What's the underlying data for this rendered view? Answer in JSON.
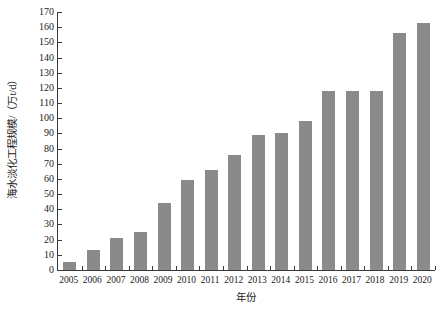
{
  "chart_data": {
    "type": "bar",
    "title": "",
    "subtitle": "",
    "xlabel": "年份",
    "ylabel": "海水淡化工程规模/（万t/d）",
    "categories": [
      "2005",
      "2006",
      "2007",
      "2008",
      "2009",
      "2010",
      "2011",
      "2012",
      "2013",
      "2014",
      "2015",
      "2016",
      "2017",
      "2018",
      "2019",
      "2020"
    ],
    "values": [
      5,
      13,
      21,
      25,
      44,
      59,
      66,
      76,
      89,
      90,
      98,
      118,
      118,
      118,
      156,
      163
    ],
    "series": [
      {
        "name": "海水淡化工程规模",
        "values": [
          5,
          13,
          21,
          25,
          44,
          59,
          66,
          76,
          89,
          90,
          98,
          118,
          118,
          118,
          156,
          163
        ]
      }
    ],
    "ylim": [
      0,
      170
    ],
    "ytick_step": 10,
    "yticks": [
      0,
      10,
      20,
      30,
      40,
      50,
      60,
      70,
      80,
      90,
      100,
      110,
      120,
      130,
      140,
      150,
      160,
      170
    ],
    "grid": false,
    "legend": false,
    "legend_position": "none",
    "bar_color": "#8a8a8a",
    "axis_color": "#3a3a3a",
    "background_color": "#ffffff"
  }
}
